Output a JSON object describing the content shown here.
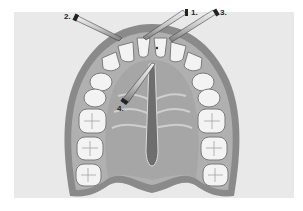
{
  "figure": {
    "labels": [
      {
        "id": "1",
        "text": "1."
      },
      {
        "id": "2",
        "text": "2."
      },
      {
        "id": "3",
        "text": "3."
      },
      {
        "id": "4",
        "text": "4."
      }
    ],
    "colors": {
      "background": "#e9e9e9",
      "gum_outer": "#8a8a8a",
      "gum_mid": "#b3b3b3",
      "palate": "#a9a9a9",
      "tooth": "#f3f3f3",
      "tooth_outline": "#7a7a7a",
      "needle": "#c8c8c8",
      "needle_dark": "#333333"
    }
  }
}
